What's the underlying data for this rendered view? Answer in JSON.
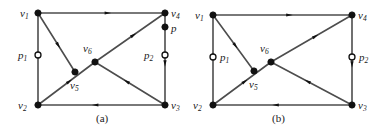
{
  "figure": {
    "caption_a": "(a)",
    "caption_b": "(b)",
    "edge_color": "#4d4d4d",
    "node_color": "#111111",
    "arrow_color": "#111111",
    "hollow_fill": "#ffffff"
  },
  "panel_a": {
    "label": "(a)",
    "nodes": [
      {
        "id": "v1",
        "text": "v",
        "sub": "1",
        "x": 38,
        "y": 13,
        "lx": 20,
        "ly": 8,
        "type": "filled"
      },
      {
        "id": "v4",
        "text": "v",
        "sub": "4",
        "x": 165,
        "y": 13,
        "lx": 171,
        "ly": 8,
        "type": "filled"
      },
      {
        "id": "v2",
        "text": "v",
        "sub": "2",
        "x": 38,
        "y": 105,
        "lx": 18,
        "ly": 100,
        "type": "filled"
      },
      {
        "id": "v3",
        "text": "v",
        "sub": "3",
        "x": 165,
        "y": 105,
        "lx": 171,
        "ly": 100,
        "type": "filled"
      },
      {
        "id": "v5",
        "text": "v",
        "sub": "5",
        "x": 75,
        "y": 72,
        "lx": 70,
        "ly": 80,
        "type": "filled"
      },
      {
        "id": "v6",
        "text": "v",
        "sub": "6",
        "x": 95,
        "y": 62,
        "lx": 83,
        "ly": 43,
        "type": "filled"
      },
      {
        "id": "p",
        "text": "p",
        "sub": "",
        "x": 165,
        "y": 27,
        "lx": 171,
        "ly": 23,
        "type": "filled"
      },
      {
        "id": "p1",
        "text": "p",
        "sub": "1",
        "x": 38,
        "y": 55,
        "lx": 18,
        "ly": 50,
        "type": "hollow"
      },
      {
        "id": "p2",
        "text": "p",
        "sub": "2",
        "x": 165,
        "y": 55,
        "lx": 144,
        "ly": 50,
        "type": "hollow"
      }
    ],
    "edges": [
      {
        "from": "v1",
        "to": "v4",
        "label": "v1-v4"
      },
      {
        "from": "v1",
        "to": "v5",
        "label": "v1-v5"
      },
      {
        "from": "v2",
        "to": "v1",
        "label": "v2-v1"
      },
      {
        "from": "v2",
        "to": "v6",
        "label": "v2-v6"
      },
      {
        "from": "v6",
        "to": "v4",
        "label": "v6-v4"
      },
      {
        "from": "v3",
        "to": "v6",
        "label": "v3-v6"
      },
      {
        "from": "v3",
        "to": "v2",
        "label": "v3-v2"
      },
      {
        "from": "v4",
        "to": "v3",
        "label": "v4-v3"
      }
    ]
  },
  "panel_b": {
    "label": "(b)",
    "nodes": [
      {
        "id": "v1",
        "text": "v",
        "sub": "1",
        "x": 213,
        "y": 15,
        "lx": 195,
        "ly": 10,
        "type": "filled"
      },
      {
        "id": "v4",
        "text": "v",
        "sub": "4",
        "x": 352,
        "y": 15,
        "lx": 358,
        "ly": 10,
        "type": "filled"
      },
      {
        "id": "v2",
        "text": "v",
        "sub": "2",
        "x": 213,
        "y": 105,
        "lx": 193,
        "ly": 100,
        "type": "filled"
      },
      {
        "id": "v3",
        "text": "v",
        "sub": "3",
        "x": 352,
        "y": 105,
        "lx": 358,
        "ly": 100,
        "type": "filled"
      },
      {
        "id": "v5",
        "text": "v",
        "sub": "5",
        "x": 254,
        "y": 71,
        "lx": 249,
        "ly": 79,
        "type": "filled"
      },
      {
        "id": "v6",
        "text": "v",
        "sub": "6",
        "x": 271,
        "y": 62,
        "lx": 260,
        "ly": 43,
        "type": "filled"
      },
      {
        "id": "p1",
        "text": "p",
        "sub": "1",
        "x": 213,
        "y": 57,
        "lx": 220,
        "ly": 52,
        "type": "hollow"
      },
      {
        "id": "p2",
        "text": "p",
        "sub": "2",
        "x": 352,
        "y": 57,
        "lx": 359,
        "ly": 52,
        "type": "hollow"
      }
    ],
    "edges": [
      {
        "from": "v1",
        "to": "v4",
        "label": "v1-v4"
      },
      {
        "from": "v1",
        "to": "v5",
        "label": "v1-v5"
      },
      {
        "from": "v2",
        "to": "v1",
        "label": "v2-v1"
      },
      {
        "from": "v2",
        "to": "v6",
        "label": "v2-v6"
      },
      {
        "from": "v6",
        "to": "v4",
        "label": "v6-v4"
      },
      {
        "from": "v3",
        "to": "v6",
        "label": "v3-v6"
      },
      {
        "from": "v3",
        "to": "v2",
        "label": "v3-v2"
      },
      {
        "from": "v4",
        "to": "v3",
        "label": "v4-v3"
      }
    ]
  },
  "captions": {
    "a": {
      "text": "(a)",
      "x": 96,
      "y": 113
    },
    "b": {
      "text": "(b)",
      "x": 272,
      "y": 113
    }
  }
}
